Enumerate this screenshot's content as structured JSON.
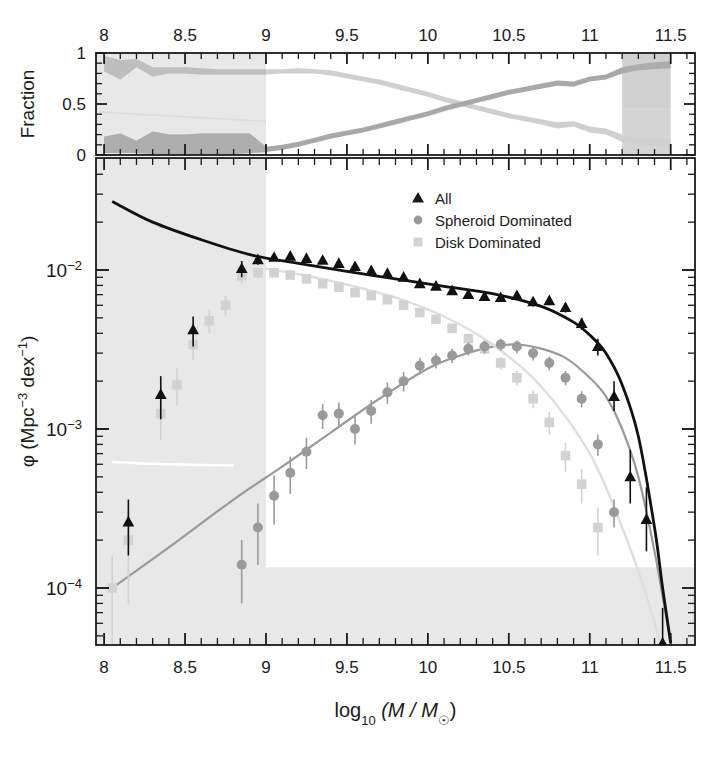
{
  "figure": {
    "title": "",
    "background_color": "#ffffff",
    "width": 717,
    "height": 768
  },
  "axis_labels": {
    "x_label_main": "log",
    "x_label_sub": "10",
    "x_label_rest": " (M / M",
    "x_label_sun": "☉",
    "x_label_close": ")",
    "y_label_phi": "φ (Mpc",
    "y_label_sup1": "−3",
    "y_label_dex": " dex",
    "y_label_sup2": "−1",
    "y_label_close": ")",
    "y_label_top": "Fraction"
  },
  "legend": {
    "position": "top-center-right",
    "entries": [
      {
        "label": "All",
        "marker": "triangle",
        "color": "#1a1a1a"
      },
      {
        "label": "Spheroid Dominated",
        "marker": "circle",
        "color": "#9a9a9a"
      },
      {
        "label": "Disk Dominated",
        "marker": "square",
        "color": "#d2d2d2"
      }
    ]
  },
  "colors": {
    "all": "#111111",
    "spheroid": "#9a9a9a",
    "disk": "#d2d2d2",
    "spheroid_band": "#a8a8a8",
    "disk_band": "#cfcfcf",
    "shading": "#e8e8e8",
    "shading_dark": "#b0b0b0",
    "axis": "#1a1a1a",
    "white_fit": "#ffffff"
  },
  "chart_data": [
    {
      "type": "area",
      "name": "fraction-panel",
      "title": "",
      "xlabel": "",
      "ylabel": "Fraction",
      "xlim": [
        7.95,
        11.65
      ],
      "ylim": [
        0,
        1
      ],
      "xticks": [
        8,
        8.5,
        9,
        9.5,
        10,
        10.5,
        11,
        11.5
      ],
      "xticklabels": [
        "8",
        "8.5",
        "9",
        "9.5",
        "10",
        "10.5",
        "11",
        "11.5"
      ],
      "yticks": [
        0,
        0.5,
        1
      ],
      "yticklabels": [
        "0",
        "0.5",
        "1"
      ],
      "grid": false,
      "legend_position": "none",
      "x": [
        8.0,
        8.1,
        8.2,
        8.3,
        8.4,
        8.5,
        8.6,
        8.7,
        8.8,
        8.9,
        9.0,
        9.1,
        9.2,
        9.3,
        9.4,
        9.5,
        9.6,
        9.7,
        9.8,
        9.9,
        10.0,
        10.1,
        10.2,
        10.3,
        10.4,
        10.5,
        10.6,
        10.7,
        10.8,
        10.9,
        11.0,
        11.1,
        11.2,
        11.3,
        11.4,
        11.5
      ],
      "series": [
        {
          "name": "Disk Dominated fraction",
          "color": "#cfcfcf",
          "lower": [
            0.82,
            0.74,
            0.86,
            0.77,
            0.8,
            0.8,
            0.79,
            0.79,
            0.79,
            0.79,
            0.79,
            0.8,
            0.8,
            0.8,
            0.78,
            0.75,
            0.72,
            0.69,
            0.65,
            0.61,
            0.57,
            0.52,
            0.48,
            0.44,
            0.4,
            0.36,
            0.33,
            0.3,
            0.26,
            0.28,
            0.22,
            0.2,
            0.13,
            0.1,
            0.09,
            0.08
          ],
          "upper": [
            0.97,
            0.93,
            0.94,
            0.86,
            0.86,
            0.86,
            0.85,
            0.84,
            0.84,
            0.84,
            0.84,
            0.84,
            0.85,
            0.84,
            0.83,
            0.8,
            0.77,
            0.74,
            0.7,
            0.66,
            0.62,
            0.57,
            0.53,
            0.49,
            0.45,
            0.41,
            0.38,
            0.35,
            0.32,
            0.33,
            0.28,
            0.26,
            0.2,
            0.17,
            0.16,
            0.16
          ]
        },
        {
          "name": "Spheroid Dominated fraction",
          "color": "#a8a8a8",
          "lower": [
            0.02,
            0.02,
            0.02,
            0.01,
            0.01,
            0.01,
            0.01,
            0.01,
            0.01,
            0.02,
            0.03,
            0.05,
            0.08,
            0.12,
            0.16,
            0.19,
            0.22,
            0.26,
            0.3,
            0.34,
            0.38,
            0.43,
            0.47,
            0.51,
            0.55,
            0.59,
            0.62,
            0.65,
            0.68,
            0.67,
            0.72,
            0.74,
            0.8,
            0.83,
            0.84,
            0.85
          ],
          "upper": [
            0.18,
            0.21,
            0.14,
            0.23,
            0.2,
            0.2,
            0.21,
            0.21,
            0.21,
            0.21,
            0.08,
            0.1,
            0.13,
            0.17,
            0.21,
            0.24,
            0.27,
            0.31,
            0.35,
            0.39,
            0.43,
            0.48,
            0.52,
            0.56,
            0.6,
            0.64,
            0.67,
            0.7,
            0.73,
            0.72,
            0.77,
            0.79,
            0.86,
            0.89,
            0.91,
            0.92
          ]
        }
      ],
      "shaded_region_x": [
        7.95,
        9.0
      ],
      "annotation": "grey vertical band masks log M < 9 incompleteness region"
    },
    {
      "type": "scatter",
      "name": "stellar-mass-function-panel",
      "title": "",
      "xlabel": "log10 (M / Msun)",
      "ylabel": "phi (Mpc^-3 dex^-1)",
      "xlim": [
        7.95,
        11.65
      ],
      "ylim": [
        4.5e-05,
        0.042
      ],
      "yscale": "log",
      "xticks": [
        8,
        8.5,
        9,
        9.5,
        10,
        10.5,
        11,
        11.5
      ],
      "xticklabels": [
        "8",
        "8.5",
        "9",
        "9.5",
        "10",
        "10.5",
        "11",
        "11.5"
      ],
      "yticks": [
        0.01,
        0.001,
        0.0001
      ],
      "yticklabels": [
        "10⁻²",
        "10⁻³",
        "10⁻⁴"
      ],
      "grid": false,
      "legend_position": "top-right",
      "shaded_region_x": [
        7.95,
        9.0
      ],
      "shaded_region_y_below": 0.000135,
      "series": [
        {
          "name": "All",
          "marker": "triangle",
          "color": "#111111",
          "x": [
            8.15,
            8.35,
            8.55,
            8.85,
            8.95,
            9.05,
            9.15,
            9.25,
            9.35,
            9.45,
            9.55,
            9.65,
            9.75,
            9.85,
            9.95,
            10.05,
            10.15,
            10.25,
            10.35,
            10.45,
            10.55,
            10.65,
            10.75,
            10.85,
            10.95,
            11.05,
            11.15,
            11.25,
            11.35,
            11.45
          ],
          "y": [
            0.00026,
            0.00165,
            0.0042,
            0.0102,
            0.0116,
            0.012,
            0.0122,
            0.0118,
            0.0115,
            0.011,
            0.0105,
            0.0099,
            0.0095,
            0.009,
            0.0082,
            0.0079,
            0.0074,
            0.007,
            0.0068,
            0.0067,
            0.0069,
            0.0063,
            0.0064,
            0.0058,
            0.0046,
            0.0033,
            0.0016,
            0.0005,
            0.00027,
            4.5e-05
          ],
          "yerr_lo": [
            0.0001,
            0.0005,
            0.0009,
            0.0012,
            0.0008,
            0.0006,
            0.0006,
            0.0005,
            0.0005,
            0.0005,
            0.0004,
            0.0004,
            0.0004,
            0.0004,
            0.0004,
            0.0004,
            0.0004,
            0.0004,
            0.0004,
            0.0004,
            0.0004,
            0.0004,
            0.0004,
            0.0004,
            0.0004,
            0.0004,
            0.0003,
            0.00016,
            0.0001,
            2e-05
          ],
          "yerr_hi": [
            0.0001,
            0.0005,
            0.0009,
            0.0012,
            0.0008,
            0.0006,
            0.0006,
            0.0005,
            0.0005,
            0.0005,
            0.0004,
            0.0004,
            0.0004,
            0.0004,
            0.0004,
            0.0004,
            0.0004,
            0.0004,
            0.0004,
            0.0004,
            0.0004,
            0.0004,
            0.0004,
            0.0004,
            0.0004,
            0.0004,
            0.0004,
            0.00024,
            0.00016,
            3e-05
          ]
        },
        {
          "name": "Spheroid Dominated",
          "marker": "circle",
          "color": "#9a9a9a",
          "x": [
            8.85,
            8.95,
            9.05,
            9.15,
            9.25,
            9.35,
            9.45,
            9.55,
            9.65,
            9.75,
            9.85,
            9.95,
            10.05,
            10.15,
            10.25,
            10.35,
            10.45,
            10.55,
            10.65,
            10.75,
            10.85,
            10.95,
            11.05,
            11.15
          ],
          "y": [
            0.00014,
            0.00024,
            0.00038,
            0.00053,
            0.00072,
            0.00122,
            0.00125,
            0.001,
            0.0013,
            0.0017,
            0.002,
            0.0025,
            0.0027,
            0.0029,
            0.0032,
            0.0033,
            0.0034,
            0.0033,
            0.003,
            0.0026,
            0.0021,
            0.00155,
            0.0008,
            0.0003
          ],
          "yerr_lo": [
            6e-05,
            0.0001,
            0.00013,
            0.00014,
            0.00016,
            0.00022,
            0.00022,
            0.0002,
            0.00022,
            0.00026,
            0.00028,
            0.0003,
            0.0003,
            0.0003,
            0.0003,
            0.0003,
            0.0003,
            0.0003,
            0.0003,
            0.00026,
            0.00022,
            0.00018,
            0.00012,
            6e-05
          ],
          "yerr_hi": [
            6e-05,
            0.0001,
            0.00013,
            0.00014,
            0.00016,
            0.00022,
            0.00022,
            0.0002,
            0.00022,
            0.00026,
            0.00028,
            0.0003,
            0.0003,
            0.0003,
            0.0003,
            0.0003,
            0.0003,
            0.0003,
            0.0003,
            0.00026,
            0.00022,
            0.00018,
            0.00012,
            6e-05
          ]
        },
        {
          "name": "Disk Dominated",
          "marker": "square",
          "color": "#d2d2d2",
          "x": [
            8.05,
            8.15,
            8.35,
            8.45,
            8.55,
            8.65,
            8.75,
            8.85,
            8.95,
            9.05,
            9.15,
            9.25,
            9.35,
            9.45,
            9.55,
            9.65,
            9.75,
            9.85,
            9.95,
            10.05,
            10.15,
            10.25,
            10.35,
            10.45,
            10.55,
            10.65,
            10.75,
            10.85,
            10.95,
            11.05
          ],
          "y": [
            0.0001,
            0.0002,
            0.00125,
            0.0019,
            0.0034,
            0.0048,
            0.006,
            0.0092,
            0.0096,
            0.0096,
            0.0093,
            0.0088,
            0.0082,
            0.0078,
            0.0072,
            0.0069,
            0.0065,
            0.006,
            0.0054,
            0.0049,
            0.0043,
            0.0037,
            0.0032,
            0.0026,
            0.0021,
            0.00155,
            0.0011,
            0.00068,
            0.00045,
            0.00024
          ],
          "yerr_lo": [
            6e-05,
            0.00012,
            0.0004,
            0.0005,
            0.0007,
            0.0008,
            0.0009,
            0.001,
            0.0007,
            0.0006,
            0.0005,
            0.0005,
            0.00045,
            0.0004,
            0.0004,
            0.0004,
            0.00035,
            0.00035,
            0.0003,
            0.0003,
            0.0003,
            0.00028,
            0.00026,
            0.00024,
            0.00022,
            0.0002,
            0.00018,
            0.00014,
            0.00011,
            8e-05
          ],
          "yerr_hi": [
            6e-05,
            0.00012,
            0.0004,
            0.0005,
            0.0007,
            0.0008,
            0.0009,
            0.001,
            0.0007,
            0.0006,
            0.0005,
            0.0005,
            0.00045,
            0.0004,
            0.0004,
            0.0004,
            0.00035,
            0.00035,
            0.0003,
            0.0003,
            0.0003,
            0.00028,
            0.00026,
            0.00024,
            0.00022,
            0.0002,
            0.00018,
            0.00014,
            0.00011,
            8e-05
          ]
        }
      ],
      "fits": [
        {
          "name": "All fit",
          "color": "#111111",
          "x": [
            8.05,
            8.3,
            8.6,
            8.9,
            9.2,
            9.5,
            9.8,
            10.1,
            10.4,
            10.7,
            10.9,
            11.0,
            11.1,
            11.2,
            11.3,
            11.4,
            11.45,
            11.5
          ],
          "y": [
            0.027,
            0.02,
            0.0155,
            0.0125,
            0.011,
            0.0098,
            0.0088,
            0.0079,
            0.0071,
            0.0059,
            0.0047,
            0.0039,
            0.003,
            0.0019,
            0.0009,
            0.00024,
            0.0001,
            4.5e-05
          ]
        },
        {
          "name": "Spheroid Dominated fit",
          "color": "#9a9a9a",
          "x": [
            8.05,
            8.4,
            8.8,
            9.1,
            9.4,
            9.7,
            10.0,
            10.2,
            10.4,
            10.55,
            10.7,
            10.85,
            11.0,
            11.1,
            11.2,
            11.3,
            11.4,
            11.5
          ],
          "y": [
            0.0001,
            0.00018,
            0.00036,
            0.00058,
            0.00095,
            0.00155,
            0.0024,
            0.0029,
            0.0033,
            0.0034,
            0.0032,
            0.0028,
            0.0021,
            0.0016,
            0.001,
            0.0005,
            0.00017,
            4.5e-05
          ]
        },
        {
          "name": "Disk Dominated fit",
          "color": "#ffffff",
          "x": [
            8.05,
            8.4,
            8.8,
            9.0,
            9.2,
            9.5,
            9.8,
            10.1,
            10.4,
            10.7,
            11.0,
            11.2,
            11.35,
            11.45
          ],
          "y": [
            0.00062,
            0.0006,
            0.00059,
            0.0102,
            0.0094,
            0.0081,
            0.0067,
            0.0051,
            0.0034,
            0.00185,
            0.0007,
            0.00024,
            9e-05,
            4e-05
          ]
        }
      ]
    }
  ]
}
